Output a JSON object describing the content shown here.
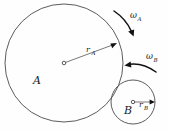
{
  "figure": {
    "background_color": "#fefefe",
    "outline_color": "#4a4a4a",
    "ink_color": "#111111"
  },
  "bodies": [
    {
      "id": "A",
      "label": "A",
      "center": {
        "x": 64,
        "y": 63
      },
      "radius": 59,
      "radius_label_base": "r",
      "radius_label_sub": "A",
      "label_position": {
        "x": 33,
        "y": 84
      },
      "radius_label_position": {
        "x": 88,
        "y": 52
      },
      "radius_vector_tip": {
        "x": 117,
        "y": 43
      }
    },
    {
      "id": "B",
      "label": "B",
      "center": {
        "x": 133,
        "y": 102
      },
      "radius": 22,
      "radius_label_base": "r",
      "radius_label_sub": "B",
      "label_position": {
        "x": 124,
        "y": 114
      },
      "radius_label_position": {
        "x": 142,
        "y": 108
      },
      "radius_vector_tip": {
        "x": 155,
        "y": 102
      }
    }
  ],
  "angular_velocities": [
    {
      "id": "omega-A",
      "symbol": "ω",
      "subscript": "A",
      "label_position": {
        "x": 134,
        "y": 18
      },
      "direction": "clockwise",
      "arc_start": {
        "x": 114,
        "y": 11
      },
      "arc_end": {
        "x": 133,
        "y": 35
      }
    },
    {
      "id": "omega-B",
      "symbol": "ω",
      "subscript": "B",
      "label_position": {
        "x": 150,
        "y": 59
      },
      "direction": "counterclockwise",
      "arc_start": {
        "x": 154,
        "y": 71
      },
      "arc_end": {
        "x": 125,
        "y": 65
      }
    }
  ],
  "canvas": {
    "width": 169,
    "height": 131
  }
}
